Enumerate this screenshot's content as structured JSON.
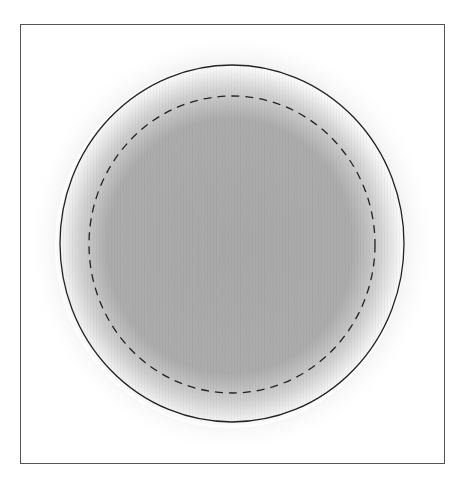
{
  "diagram": {
    "type": "concentric-circles",
    "frame": {
      "x": 20,
      "y": 24,
      "width": 425,
      "height": 440,
      "stroke": "#555555"
    },
    "outer_circle": {
      "cx": 232,
      "cy": 243,
      "rx": 172,
      "ry": 179,
      "stroke": "#222222",
      "style": "solid"
    },
    "inner_circle": {
      "cx": 232,
      "cy": 244,
      "rx": 143,
      "ry": 149,
      "stroke": "#222222",
      "style": "dashed"
    },
    "fill": {
      "center_color": "#a9a9a9",
      "edge_color": "#ffffff",
      "style": "radial-gradient"
    }
  }
}
